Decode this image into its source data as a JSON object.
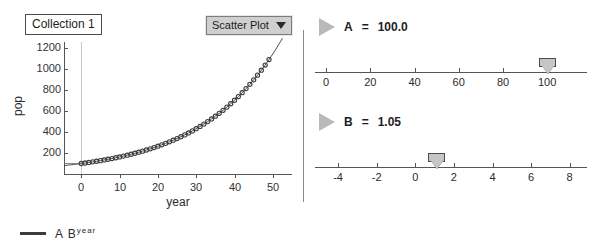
{
  "collection": {
    "title": "Collection 1"
  },
  "plot_menu": {
    "label": "Scatter Plot",
    "caret_icon": "chevron-down-icon"
  },
  "legend": {
    "prefix": "A B",
    "exponent": "year"
  },
  "sliders": [
    {
      "name": "A",
      "equals": "=",
      "value": "100.0",
      "play_icon": "play-triangle-icon",
      "ticks": [
        "0",
        "20",
        "40",
        "60",
        "80",
        "100"
      ],
      "tick_values": [
        0,
        20,
        40,
        60,
        80,
        100
      ],
      "axis_min": -5,
      "axis_max": 118,
      "thumb_value": 100
    },
    {
      "name": "B",
      "equals": "=",
      "value": "1.05",
      "play_icon": "play-triangle-icon",
      "ticks": [
        "-4",
        "-2",
        "0",
        "2",
        "4",
        "6",
        "8"
      ],
      "tick_values": [
        -4,
        -2,
        0,
        2,
        4,
        6,
        8
      ],
      "axis_min": -5.2,
      "axis_max": 8.9,
      "thumb_value": 1.05
    }
  ],
  "chart_data": {
    "type": "scatter",
    "title": "Collection 1",
    "xlabel": "year",
    "ylabel": "pop",
    "xlim": [
      -4.5,
      55
    ],
    "ylim": [
      0,
      1260
    ],
    "xticks": [
      0,
      10,
      20,
      30,
      40,
      50
    ],
    "xtick_labels": [
      "0",
      "10",
      "20",
      "30",
      "40",
      "50"
    ],
    "yticks": [
      200,
      400,
      600,
      800,
      1000,
      1200
    ],
    "ytick_labels": [
      "200",
      "400",
      "600",
      "800",
      "1000",
      "1200"
    ],
    "grid": false,
    "gridlines_x": [
      0
    ],
    "legend": "A B^year",
    "legend_position": "below-axes",
    "fit": {
      "kind": "exponential",
      "formula": "A * B^year",
      "A": 100.0,
      "B": 1.05,
      "line_color": "#333333"
    },
    "series": [
      {
        "name": "pop",
        "marker": "open-circle",
        "marker_color": "#3c3c3c",
        "x": [
          0,
          1,
          2,
          3,
          4,
          5,
          6,
          7,
          8,
          9,
          10,
          11,
          12,
          13,
          14,
          15,
          16,
          17,
          18,
          19,
          20,
          21,
          22,
          23,
          24,
          25,
          26,
          27,
          28,
          29,
          30,
          31,
          32,
          33,
          34,
          35,
          36,
          37,
          38,
          39,
          40,
          41,
          42,
          43,
          44,
          45,
          46,
          47,
          48,
          49
        ],
        "y": [
          100,
          105,
          110.3,
          115.8,
          121.6,
          127.6,
          134,
          140.7,
          147.7,
          155.1,
          162.9,
          171,
          179.6,
          188.6,
          198,
          207.9,
          218.3,
          229.2,
          240.7,
          252.7,
          265.3,
          278.6,
          292.5,
          307.2,
          322.5,
          338.6,
          355.6,
          373.3,
          392,
          411.6,
          432.2,
          453.8,
          476.5,
          500.3,
          525.3,
          551.6,
          579.2,
          608.1,
          638.5,
          670.5,
          704,
          739.2,
          776.2,
          815,
          855.8,
          898.6,
          943.5,
          990.7,
          1040.2,
          1092.3
        ]
      }
    ]
  }
}
